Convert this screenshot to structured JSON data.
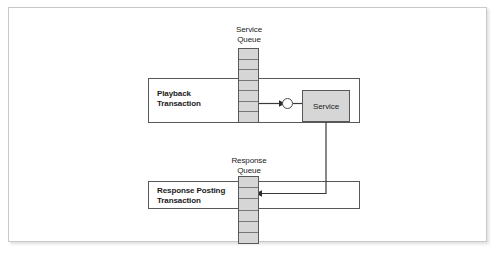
{
  "figure": {
    "type": "block-flow-diagram",
    "background_color": "#ffffff",
    "frame_border_color": "#c9c9c9",
    "line_color": "#58585a",
    "fill_gray": "#d6d6d6",
    "text_color": "#1b1b1b"
  },
  "queues": {
    "service": {
      "caption": "Service\nQueue",
      "cell_count": 7
    },
    "response": {
      "caption": "Response\nQueue",
      "cell_count": 6
    }
  },
  "transactions": {
    "playback": {
      "label": "Playback\nTransaction"
    },
    "response_posting": {
      "label": "Response Posting\nTransaction"
    }
  },
  "components": {
    "service": {
      "label": "Service"
    },
    "connector_node": {
      "label": ""
    }
  },
  "flows": [
    {
      "name": "service-queue-to-service",
      "from": "Service Queue",
      "to": "Service",
      "direction": "right",
      "arrowhead": true
    },
    {
      "name": "service-to-response-queue",
      "from": "Service",
      "to": "Response Queue",
      "direction": "down-then-left",
      "arrowhead": true
    }
  ]
}
